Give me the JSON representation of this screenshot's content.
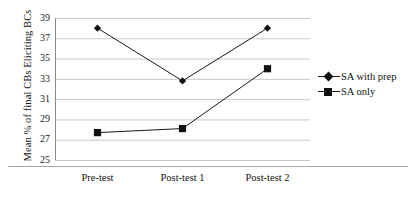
{
  "chart_data": {
    "type": "line",
    "title": "",
    "xlabel": "",
    "ylabel": "Mean % of final CBs Eliciting BCs",
    "categories": [
      "Pre-test",
      "Post-test 1",
      "Post-test 2"
    ],
    "series": [
      {
        "name": "SA with prep",
        "marker": "diamond",
        "color": "#111111",
        "values": [
          38.0,
          32.8,
          38.0
        ]
      },
      {
        "name": "SA only",
        "marker": "square",
        "color": "#111111",
        "values": [
          27.7,
          28.1,
          34.0
        ]
      }
    ],
    "ylim": [
      25,
      39
    ],
    "yticks": [
      25,
      27,
      29,
      31,
      33,
      35,
      37,
      39
    ],
    "ytick_labels": [
      "25",
      "27",
      "29",
      "31",
      "33",
      "35",
      "37",
      "39"
    ],
    "grid": "horizontal",
    "legend_position": "right",
    "gridline_color": "#c9c9c9",
    "axis_color": "#8a8a8a",
    "line_color": "#1a1a1a",
    "background": "#ffffff"
  },
  "legend": {
    "items": [
      {
        "label": "SA with prep",
        "marker": "diamond-marker"
      },
      {
        "label": "SA only",
        "marker": "square-marker"
      }
    ]
  }
}
